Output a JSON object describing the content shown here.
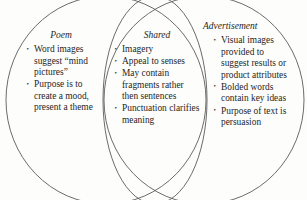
{
  "diagram": {
    "type": "venn-diagram",
    "shape": "three-overlapping-ellipses",
    "background_color": "#fdfdfc",
    "stroke_color": "#5a5a5a",
    "text_color": "#262626",
    "regions": [
      {
        "id": "poem",
        "heading": "Poem",
        "items": [
          "Word images suggest “mind pictures”",
          "Purpose is to create a mood, present a theme"
        ]
      },
      {
        "id": "shared",
        "heading": "Shared",
        "items": [
          "Imagery",
          "Appeal to senses",
          "May contain fragments rather then sentences",
          "Punctuation clarifies meaning"
        ]
      },
      {
        "id": "advertisement",
        "heading": "Advertisement",
        "items": [
          "Visual images provided to suggest results or product attributes",
          "Bolded words contain key ideas",
          "Purpose of text is persuasion"
        ]
      }
    ]
  }
}
